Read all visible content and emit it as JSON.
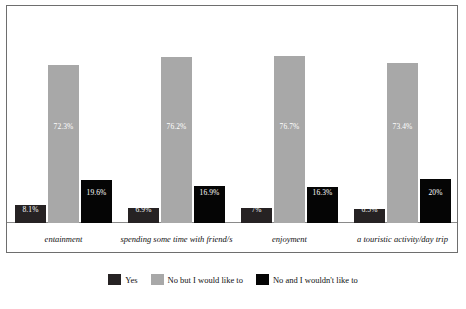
{
  "chart_data": {
    "type": "bar",
    "title": "",
    "subtitle": "",
    "xlabel": "",
    "ylabel": "",
    "ylim": [
      0,
      100
    ],
    "grid": false,
    "legend_position": "bottom-center",
    "categories": [
      "entainment",
      "spending some time with friend/s",
      "enjoyment",
      "a touristic activity/day trip"
    ],
    "series": [
      {
        "name": "Yes",
        "color": "#262223",
        "values": [
          8.1,
          6.9,
          7,
          6.5
        ],
        "labels": [
          "8.1%",
          "6.9%",
          "7%",
          "6.5%"
        ]
      },
      {
        "name": "No but I would like to",
        "color": "#a8a8a8",
        "values": [
          72.3,
          76.2,
          76.7,
          73.4
        ],
        "labels": [
          "72.3%",
          "76.2%",
          "76.7%",
          "73.4%"
        ]
      },
      {
        "name": "No and I wouldn't like to",
        "color": "#050505",
        "values": [
          19.6,
          16.9,
          16.3,
          20
        ],
        "labels": [
          "19.6%",
          "16.9%",
          "16.3%",
          "20%"
        ]
      }
    ]
  },
  "legend": {
    "items": [
      {
        "label": "Yes",
        "color": "#262223"
      },
      {
        "label": "No but I would like to",
        "color": "#a8a8a8"
      },
      {
        "label": "No and I wouldn't like to",
        "color": "#050505"
      }
    ]
  }
}
